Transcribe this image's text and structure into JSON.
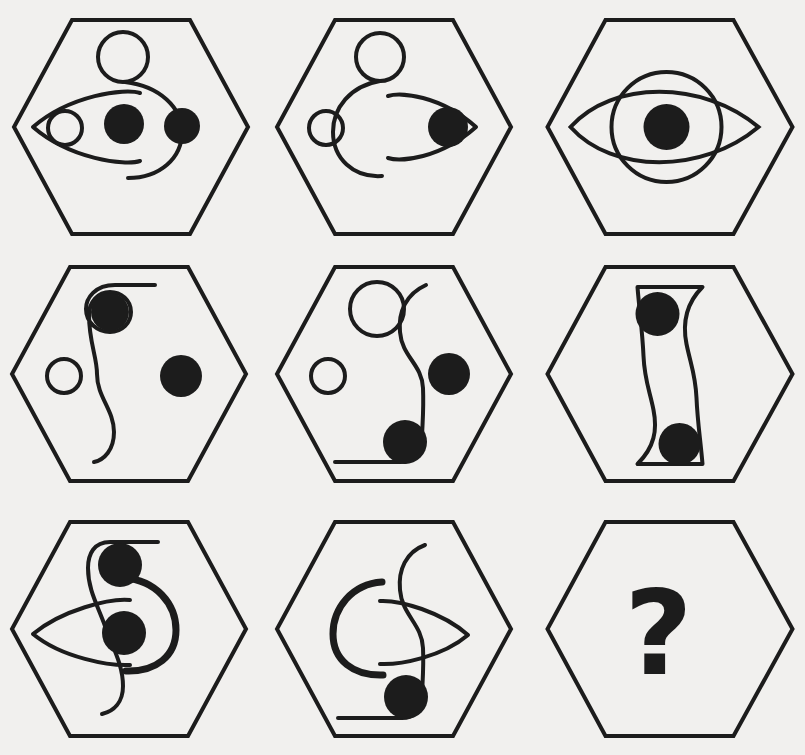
{
  "puzzle": {
    "type": "visual-analogy-matrix",
    "background_color": "#f1f0ee",
    "ink_color": "#1c1c1c",
    "grid": {
      "rows": 3,
      "columns": 3
    },
    "frame_shape": "hexagon",
    "missing_cell_label": "?",
    "cells": [
      {
        "id": "cell-r1c1",
        "row": 1,
        "column": 1,
        "elements": [
          "hook-six-curve",
          "lens-pointing-left",
          "small-hollow-circle",
          "filled-dot",
          "filled-dot"
        ],
        "hollow_circle_count": 2,
        "filled_dot_count": 2
      },
      {
        "id": "cell-r1c2",
        "row": 1,
        "column": 2,
        "elements": [
          "hook-six-curve",
          "lens-pointing-right",
          "small-hollow-circle",
          "filled-dot"
        ],
        "hollow_circle_count": 2,
        "filled_dot_count": 1
      },
      {
        "id": "cell-r1c3",
        "row": 1,
        "column": 3,
        "elements": [
          "large-hollow-circle",
          "lens-horizontal",
          "filled-dot"
        ],
        "hollow_circle_count": 1,
        "filled_dot_count": 1
      },
      {
        "id": "cell-r2c1",
        "row": 2,
        "column": 1,
        "elements": [
          "s-curve-with-spiral-top",
          "small-hollow-circle",
          "filled-dot",
          "filled-dot"
        ],
        "hollow_circle_count": 2,
        "filled_dot_count": 2
      },
      {
        "id": "cell-r2c2",
        "row": 2,
        "column": 2,
        "elements": [
          "s-curve",
          "hollow-circle",
          "small-hollow-circle",
          "filled-dot",
          "filled-dot"
        ],
        "hollow_circle_count": 2,
        "filled_dot_count": 2
      },
      {
        "id": "cell-r2c3",
        "row": 2,
        "column": 3,
        "elements": [
          "double-s-curve-closed",
          "filled-dot",
          "filled-dot"
        ],
        "hollow_circle_count": 0,
        "filled_dot_count": 2
      },
      {
        "id": "cell-r3c1",
        "row": 3,
        "column": 1,
        "elements": [
          "s-curve",
          "thick-c-arc",
          "lens-pointing-left",
          "filled-dot",
          "filled-dot"
        ],
        "hollow_circle_count": 0,
        "filled_dot_count": 2
      },
      {
        "id": "cell-r3c2",
        "row": 3,
        "column": 2,
        "elements": [
          "s-curve",
          "thick-c-arc",
          "lens-pointing-right",
          "filled-dot"
        ],
        "hollow_circle_count": 0,
        "filled_dot_count": 1
      },
      {
        "id": "cell-r3c3",
        "row": 3,
        "column": 3,
        "elements": [
          "question-mark"
        ],
        "hollow_circle_count": 0,
        "filled_dot_count": 0,
        "is_answer_slot": true
      }
    ]
  }
}
